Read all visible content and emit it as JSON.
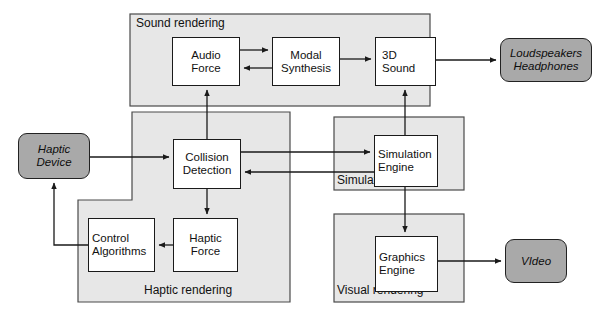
{
  "diagram": {
    "colors": {
      "panel_fill": "#e7e7e7",
      "panel_stroke": "#4a4a4a",
      "process_fill": "#ffffff",
      "process_stroke": "#1a1a1a",
      "io_fill": "#a9a9a9",
      "io_stroke": "#222222",
      "arrow": "#1a1a1a",
      "background": "#ffffff"
    },
    "panels": [
      {
        "id": "sound-rendering",
        "label": "Sound rendering",
        "x": 130,
        "y": 14,
        "w": 300,
        "h": 92,
        "label_pos": "top-left"
      },
      {
        "id": "haptic-rendering",
        "label": "Haptic rendering",
        "x": 78,
        "y": 112,
        "w": 212,
        "h": 190,
        "label_pos": "bottom-center"
      },
      {
        "id": "simulation",
        "label": "Simulation",
        "x": 334,
        "y": 117,
        "w": 130,
        "h": 73,
        "label_pos": "bottom-left"
      },
      {
        "id": "visual-rendering",
        "label": "Visual rendering",
        "x": 334,
        "y": 214,
        "w": 130,
        "h": 88,
        "label_pos": "bottom-left"
      }
    ],
    "nodes": [
      {
        "id": "audio-force",
        "type": "process",
        "lines": [
          "Audio",
          "Force"
        ],
        "x": 172,
        "y": 37,
        "w": 68,
        "h": 49
      },
      {
        "id": "modal-synthesis",
        "type": "process",
        "lines": [
          "Modal",
          "Synthesis"
        ],
        "x": 272,
        "y": 37,
        "w": 68,
        "h": 49
      },
      {
        "id": "3d-sound",
        "type": "process",
        "lines": [
          "3D",
          "Sound"
        ],
        "x": 375,
        "y": 37,
        "w": 61,
        "h": 49
      },
      {
        "id": "loudspeakers-headphones",
        "type": "io",
        "lines": [
          "Loudspeakers",
          "Headphones"
        ],
        "x": 500,
        "y": 38,
        "w": 92,
        "h": 44
      },
      {
        "id": "haptic-device",
        "type": "io",
        "lines": [
          "Haptic",
          "Device"
        ],
        "x": 18,
        "y": 133,
        "w": 72,
        "h": 46
      },
      {
        "id": "collision-detection",
        "type": "process",
        "lines": [
          "Collision",
          "Detection"
        ],
        "x": 173,
        "y": 139,
        "w": 68,
        "h": 50
      },
      {
        "id": "simulation-engine",
        "type": "process",
        "lines": [
          "Simulation",
          "Engine"
        ],
        "x": 374,
        "y": 135,
        "w": 64,
        "h": 52
      },
      {
        "id": "control-algorithms",
        "type": "process",
        "lines": [
          "Control",
          "Algorithms"
        ],
        "x": 88,
        "y": 218,
        "w": 67,
        "h": 54
      },
      {
        "id": "haptic-force",
        "type": "process",
        "lines": [
          "Haptic",
          "Force"
        ],
        "x": 173,
        "y": 218,
        "w": 65,
        "h": 54
      },
      {
        "id": "graphics-engine",
        "type": "process",
        "lines": [
          "Graphics",
          "Engine"
        ],
        "x": 375,
        "y": 236,
        "w": 63,
        "h": 56
      },
      {
        "id": "video",
        "type": "io",
        "lines": [
          "VIdeo"
        ],
        "x": 505,
        "y": 239,
        "w": 62,
        "h": 44
      }
    ],
    "edges": [
      {
        "id": "audio-force-to-modal-synthesis",
        "from": "audio-force",
        "to": "modal-synthesis",
        "direction": "right"
      },
      {
        "id": "modal-synthesis-to-audio-force",
        "from": "modal-synthesis",
        "to": "audio-force",
        "direction": "left"
      },
      {
        "id": "modal-synthesis-to-3d-sound",
        "from": "modal-synthesis",
        "to": "3d-sound",
        "direction": "right"
      },
      {
        "id": "3d-sound-to-loudspeakers",
        "from": "3d-sound",
        "to": "loudspeakers-headphones",
        "direction": "right"
      },
      {
        "id": "collision-detection-to-audio-force",
        "from": "collision-detection",
        "to": "audio-force",
        "direction": "up"
      },
      {
        "id": "simulation-engine-to-3d-sound",
        "from": "simulation-engine",
        "to": "3d-sound",
        "direction": "up"
      },
      {
        "id": "haptic-device-to-collision-detection",
        "from": "haptic-device",
        "to": "collision-detection",
        "direction": "right"
      },
      {
        "id": "collision-detection-to-simulation-engine",
        "from": "collision-detection",
        "to": "simulation-engine",
        "direction": "right"
      },
      {
        "id": "simulation-engine-to-collision-detection",
        "from": "simulation-engine",
        "to": "collision-detection",
        "direction": "left"
      },
      {
        "id": "collision-detection-to-haptic-force",
        "from": "collision-detection",
        "to": "haptic-force",
        "direction": "down"
      },
      {
        "id": "haptic-force-to-control-algorithms",
        "from": "haptic-force",
        "to": "control-algorithms",
        "direction": "left"
      },
      {
        "id": "control-algorithms-to-haptic-device",
        "from": "control-algorithms",
        "to": "haptic-device",
        "direction": "up"
      },
      {
        "id": "simulation-engine-to-graphics-engine",
        "from": "simulation-engine",
        "to": "graphics-engine",
        "direction": "down"
      },
      {
        "id": "graphics-engine-to-video",
        "from": "graphics-engine",
        "to": "video",
        "direction": "right"
      }
    ]
  }
}
